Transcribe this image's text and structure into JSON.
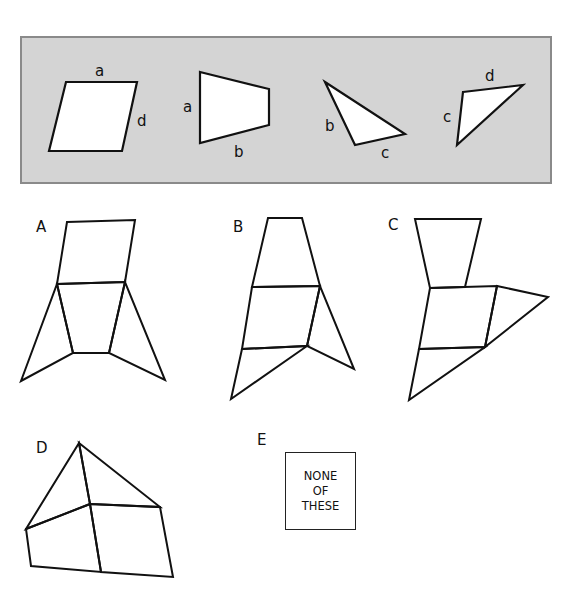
{
  "puzzle": {
    "pieces_panel": {
      "background": "#d4d4d4",
      "pieces": [
        {
          "name": "parallelogram",
          "edge_labels": [
            "a",
            "d"
          ]
        },
        {
          "name": "trapezoid",
          "edge_labels": [
            "a",
            "b"
          ]
        },
        {
          "name": "triangle-bc",
          "edge_labels": [
            "b",
            "c"
          ]
        },
        {
          "name": "triangle-cd",
          "edge_labels": [
            "c",
            "d"
          ]
        }
      ]
    },
    "options": [
      {
        "label": "A"
      },
      {
        "label": "B"
      },
      {
        "label": "C"
      },
      {
        "label": "D"
      },
      {
        "label": "E",
        "text_lines": [
          "NONE",
          "OF",
          "THESE"
        ]
      }
    ]
  }
}
